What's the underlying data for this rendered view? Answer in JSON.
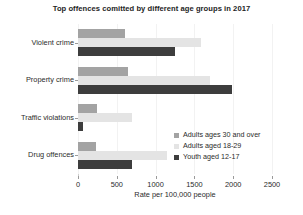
{
  "chart_data": {
    "type": "bar",
    "orientation": "horizontal",
    "title": "Top offences comitted by different age groups in 2017",
    "xlabel": "Rate per 100,000 people",
    "ylabel": "",
    "categories": [
      "Violent crime",
      "Property crime",
      "Traffic violations",
      "Drug offences"
    ],
    "series": [
      {
        "name": "Adults ages 30 and over",
        "color": "#a3a3a3",
        "values": [
          610,
          640,
          250,
          230
        ]
      },
      {
        "name": "Adults aged 18-29",
        "color": "#e4e4e4",
        "values": [
          1580,
          1700,
          700,
          1150
        ]
      },
      {
        "name": "Youth aged 12-17",
        "color": "#3d3d3d",
        "values": [
          1250,
          1980,
          60,
          690
        ]
      }
    ],
    "xlim": [
      0,
      2500
    ],
    "xticks": [
      0,
      500,
      1000,
      1500,
      2000,
      2500
    ],
    "xtick_labels": [
      "0",
      "500",
      "1000",
      "1500",
      "2000",
      "2500"
    ],
    "grid": true,
    "legend_position": "inside-right"
  }
}
